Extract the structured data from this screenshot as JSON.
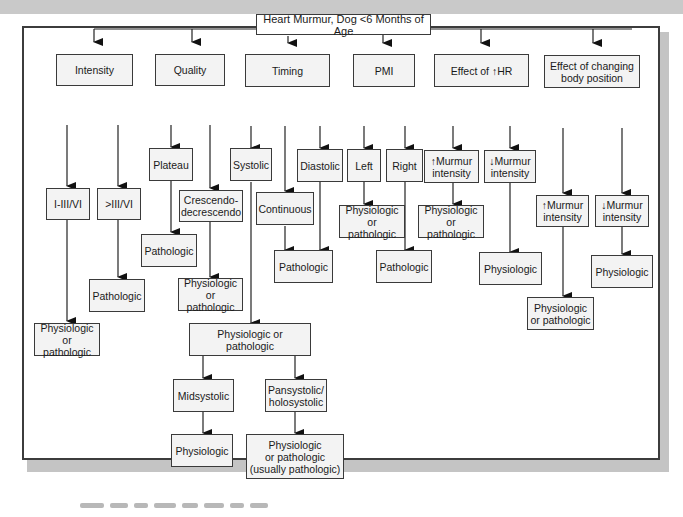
{
  "diagram": {
    "type": "decision-tree",
    "root": "Heart Murmur, Dog <6 Months of Age",
    "branches": [
      {
        "label": "Intensity",
        "children": [
          {
            "label": "I-III/VI",
            "children": [
              {
                "label": "Physiologic\nor pathologic"
              }
            ]
          },
          {
            "label": ">III/VI",
            "children": [
              {
                "label": "Pathologic"
              }
            ]
          }
        ]
      },
      {
        "label": "Quality",
        "children": [
          {
            "label": "Plateau",
            "children": [
              {
                "label": "Pathologic"
              }
            ]
          },
          {
            "label": "Crescendo-\ndecrescendo",
            "children": [
              {
                "label": "Physiologic\nor pathologic"
              }
            ]
          }
        ]
      },
      {
        "label": "Timing",
        "children": [
          {
            "label": "Systolic",
            "children": [
              {
                "label": "Physiologic or pathologic",
                "children": [
                  {
                    "label": "Midsystolic",
                    "children": [
                      {
                        "label": "Physiologic"
                      }
                    ]
                  },
                  {
                    "label": "Pansystolic/\nholosystolic",
                    "children": [
                      {
                        "label": "Physiologic\nor pathologic\n(usually pathologic)"
                      }
                    ]
                  }
                ]
              }
            ]
          },
          {
            "label": "Continuous",
            "children": [
              {
                "label": "Pathologic"
              }
            ]
          },
          {
            "label": "Diastolic",
            "children": [
              {
                "label": "Pathologic"
              }
            ]
          }
        ]
      },
      {
        "label": "PMI",
        "children": [
          {
            "label": "Left",
            "children": [
              {
                "label": "Physiologic\nor pathologic"
              }
            ]
          },
          {
            "label": "Right",
            "children": [
              {
                "label": "Pathologic"
              }
            ]
          }
        ]
      },
      {
        "label": "Effect of ↑HR",
        "children": [
          {
            "label": "↑Murmur\nintensity",
            "children": [
              {
                "label": "Physiologic\nor pathologic"
              }
            ]
          },
          {
            "label": "↓Murmur\nintensity",
            "children": [
              {
                "label": "Physiologic"
              }
            ]
          }
        ]
      },
      {
        "label": "Effect of changing\nbody position",
        "children": [
          {
            "label": "↑Murmur\nintensity",
            "children": [
              {
                "label": "Physiologic\nor pathologic"
              }
            ]
          },
          {
            "label": "↓Murmur\nintensity",
            "children": [
              {
                "label": "Physiologic"
              }
            ]
          }
        ]
      }
    ]
  },
  "nodes": {
    "root": "Heart Murmur, Dog <6 Months of Age",
    "intensity": "Intensity",
    "i_iii": "I-III/VI",
    "gt_iii": ">III/VI",
    "intensity_low_result": "Physiologic\nor pathologic",
    "intensity_high_result": "Pathologic",
    "quality": "Quality",
    "plateau": "Plateau",
    "crescendo": "Crescendo-\ndecrescendo",
    "plateau_result": "Pathologic",
    "crescendo_result": "Physiologic\nor pathologic",
    "timing": "Timing",
    "systolic": "Systolic",
    "continuous": "Continuous",
    "diastolic": "Diastolic",
    "timing_path_result": "Pathologic",
    "systolic_result": "Physiologic or pathologic",
    "midsystolic": "Midsystolic",
    "pansystolic": "Pansystolic/\nholosystolic",
    "midsystolic_result": "Physiologic",
    "pansystolic_result": "Physiologic\nor pathologic\n(usually pathologic)",
    "pmi": "PMI",
    "left": "Left",
    "right": "Right",
    "left_result": "Physiologic\nor pathologic",
    "right_result": "Pathologic",
    "hr": "Effect of ↑HR",
    "hr_up": "↑Murmur\nintensity",
    "hr_down": "↓Murmur\nintensity",
    "hr_up_result": "Physiologic\nor pathologic",
    "hr_down_result": "Physiologic",
    "body": "Effect of changing\nbody position",
    "body_up": "↑Murmur\nintensity",
    "body_down": "↓Murmur\nintensity",
    "body_up_result": "Physiologic\nor pathologic",
    "body_down_result": "Physiologic"
  },
  "caption": "Figure caption (illegible)"
}
